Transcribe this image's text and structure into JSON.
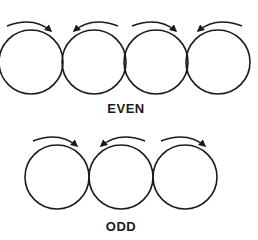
{
  "diagram": {
    "stroke_color": "#1a1a1a",
    "groups": [
      {
        "label": "EVEN",
        "label_pos": {
          "x": 90,
          "y": 101
        },
        "circles": [
          {
            "cx": 31,
            "cy": 62,
            "r": 32,
            "rotation": "clockwise"
          },
          {
            "cx": 94,
            "cy": 62,
            "r": 32,
            "rotation": "counterclockwise"
          },
          {
            "cx": 156,
            "cy": 62,
            "r": 32,
            "rotation": "clockwise"
          },
          {
            "cx": 218,
            "cy": 62,
            "r": 32,
            "rotation": "counterclockwise"
          }
        ]
      },
      {
        "label": "ODD",
        "label_pos": {
          "x": 90,
          "y": 219
        },
        "circles": [
          {
            "cx": 57,
            "cy": 177,
            "r": 32,
            "rotation": "clockwise"
          },
          {
            "cx": 121,
            "cy": 177,
            "r": 32,
            "rotation": "counterclockwise"
          },
          {
            "cx": 185,
            "cy": 177,
            "r": 32,
            "rotation": "clockwise"
          }
        ]
      }
    ]
  }
}
